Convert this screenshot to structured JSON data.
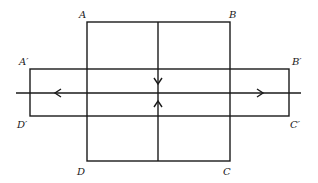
{
  "diagram": {
    "type": "geometric-figure",
    "labels": {
      "A": "A",
      "B": "B",
      "C": "C",
      "D": "D",
      "A_prime": "A′",
      "B_prime": "B′",
      "C_prime": "C′",
      "D_prime": "D′"
    },
    "shapes": {
      "square_ABCD": {
        "x": 87,
        "y": 22,
        "width": 143,
        "height": 139
      },
      "rect_ApBpCpDp": {
        "x": 30,
        "y": 69,
        "width": 259,
        "height": 47
      },
      "horizontal_line": {
        "x1": 16,
        "x2": 301,
        "y": 93
      },
      "vertical_line": {
        "x": 158,
        "y1": 22,
        "y2": 161
      }
    },
    "arrows": [
      {
        "name": "left-arrow",
        "direction": "left",
        "x": 55,
        "y": 93
      },
      {
        "name": "right-arrow",
        "direction": "right",
        "x": 263,
        "y": 93
      },
      {
        "name": "down-arrow",
        "direction": "down",
        "x": 158,
        "y": 84
      },
      {
        "name": "up-arrow",
        "direction": "up",
        "x": 158,
        "y": 101
      }
    ],
    "colors": {
      "line": "#1a1a1a",
      "background": "#ffffff"
    }
  }
}
